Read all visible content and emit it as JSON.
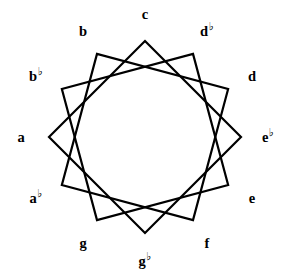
{
  "figure": {
    "background_color": "#ffffff",
    "stroke_color": "#000000",
    "text_color": "#000000",
    "stroke_width": 2.2,
    "width": 290,
    "height": 274
  },
  "chart_data": {
    "type": "diagram",
    "subtype": "star-polygon",
    "title": "",
    "point_count": 12,
    "polygon_count": 3,
    "skip": 3,
    "center": {
      "x": 145,
      "y": 137
    },
    "vertex_radius": 96,
    "label_radius": 123,
    "start_angle_deg": -90,
    "grid": false,
    "legend": false,
    "labels": [
      {
        "name": "c",
        "letter": "c",
        "accidental": "",
        "index": 0,
        "angle_deg": -90,
        "x": 145,
        "y": 14,
        "anchor": "center"
      },
      {
        "name": "db",
        "letter": "d",
        "accidental": "♭",
        "index": 1,
        "angle_deg": -60,
        "x": 207,
        "y": 31,
        "anchor": "center"
      },
      {
        "name": "d",
        "letter": "d",
        "accidental": "",
        "index": 2,
        "angle_deg": -30,
        "x": 252,
        "y": 76,
        "anchor": "center"
      },
      {
        "name": "eb",
        "letter": "e",
        "accidental": "♭",
        "index": 3,
        "angle_deg": 0,
        "x": 268,
        "y": 137,
        "anchor": "center"
      },
      {
        "name": "e",
        "letter": "e",
        "accidental": "",
        "index": 4,
        "angle_deg": 30,
        "x": 252,
        "y": 198,
        "anchor": "center"
      },
      {
        "name": "f",
        "letter": "f",
        "accidental": "",
        "index": 5,
        "angle_deg": 60,
        "x": 207,
        "y": 243,
        "anchor": "center"
      },
      {
        "name": "gb",
        "letter": "g",
        "accidental": "♭",
        "index": 6,
        "angle_deg": 90,
        "x": 145,
        "y": 261,
        "anchor": "center"
      },
      {
        "name": "g",
        "letter": "g",
        "accidental": "",
        "index": 7,
        "angle_deg": 120,
        "x": 83,
        "y": 243,
        "anchor": "center"
      },
      {
        "name": "ab",
        "letter": "a",
        "accidental": "♭",
        "index": 8,
        "angle_deg": 150,
        "x": 36,
        "y": 198,
        "anchor": "center"
      },
      {
        "name": "a",
        "letter": "a",
        "accidental": "",
        "index": 9,
        "angle_deg": 180,
        "x": 21,
        "y": 137,
        "anchor": "center"
      },
      {
        "name": "bb",
        "letter": "b",
        "accidental": "♭",
        "index": 10,
        "angle_deg": 210,
        "x": 36,
        "y": 76,
        "anchor": "center"
      },
      {
        "name": "b",
        "letter": "b",
        "accidental": "",
        "index": 11,
        "angle_deg": 240,
        "x": 83,
        "y": 31,
        "anchor": "center"
      }
    ],
    "polygons": [
      {
        "name": "square-c",
        "vertices": [
          0,
          3,
          6,
          9
        ],
        "notes": [
          "c",
          "e♭",
          "g♭",
          "a"
        ]
      },
      {
        "name": "square-db",
        "vertices": [
          1,
          4,
          7,
          10
        ],
        "notes": [
          "d♭",
          "e",
          "g",
          "b♭"
        ]
      },
      {
        "name": "square-d",
        "vertices": [
          2,
          5,
          8,
          11
        ],
        "notes": [
          "d",
          "f",
          "a♭",
          "b"
        ]
      }
    ]
  }
}
